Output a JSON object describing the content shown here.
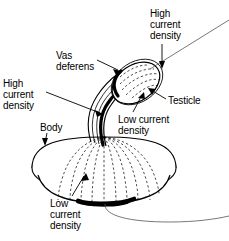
{
  "figure": {
    "type": "anatomical-schematic",
    "background_color": "#ffffff",
    "ink_color": "#000000",
    "labels": {
      "high_current_density_top": "High\ncurrent\ndensity",
      "vas_deferens": "Vas\ndeferens",
      "high_current_density_left": "High\ncurrent\ndensity",
      "testicle": "Testicle",
      "low_current_density_middle": "Low current\ndensity",
      "body": "Body",
      "low_current_density_bottom": "Low\ncurrent\ndensity"
    },
    "parts": [
      {
        "name": "body",
        "shape": "ellipsoid-dome",
        "shading": "dashed-meridians"
      },
      {
        "name": "vas-deferens",
        "shape": "curved-tube",
        "shading": "thick-dark-edge"
      },
      {
        "name": "testicle",
        "shape": "tilted-ellipse",
        "shading": "dashed-hatching"
      },
      {
        "name": "high-current-band-tube",
        "shape": "thick-black-edge"
      },
      {
        "name": "low-current-band-body-base",
        "shape": "thick-black-arc"
      },
      {
        "name": "lead-wire-upper",
        "shape": "thin-line"
      },
      {
        "name": "lead-wire-lower",
        "shape": "thin-curve"
      }
    ]
  }
}
